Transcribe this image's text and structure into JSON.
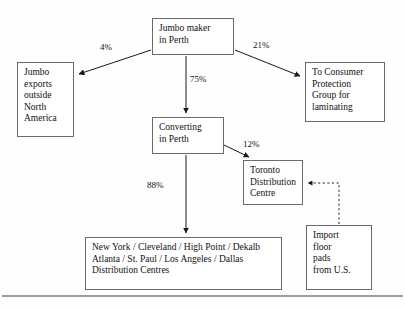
{
  "diagram": {
    "nodes": [
      {
        "id": "jumbo-maker",
        "label": "Jumbo maker\nin Perth"
      },
      {
        "id": "jumbo-exports",
        "label": "Jumbo\nexports\noutside\nNorth\nAmerica"
      },
      {
        "id": "consumer",
        "label": "To Consumer\nProtection\nGroup for\nlaminating"
      },
      {
        "id": "converting",
        "label": "Converting\nin Perth"
      },
      {
        "id": "toronto",
        "label": "Toronto\nDistribution\nCentre"
      },
      {
        "id": "import",
        "label": "Import\nfloor\npads\nfrom U.S."
      },
      {
        "id": "distribution",
        "label": "New York / Cleveland / High Point / Dekalb\nAtlanta / St. Paul /  Los Angeles / Dallas\nDistribution Centres"
      }
    ],
    "edges": [
      {
        "id": "maker-to-exports",
        "label": "4%",
        "style": "solid"
      },
      {
        "id": "maker-to-consumer",
        "label": "21%",
        "style": "solid"
      },
      {
        "id": "maker-to-converting",
        "label": "75%",
        "style": "solid"
      },
      {
        "id": "converting-to-toronto",
        "label": "12%",
        "style": "solid"
      },
      {
        "id": "converting-to-distribution",
        "label": "88%",
        "style": "solid"
      },
      {
        "id": "import-to-toronto",
        "label": "",
        "style": "dashed"
      }
    ],
    "colors": {
      "box_border": "#6b6b6b",
      "line": "#1a1a1a",
      "background": "#fefefe",
      "rule": "#3a3a3a"
    }
  }
}
